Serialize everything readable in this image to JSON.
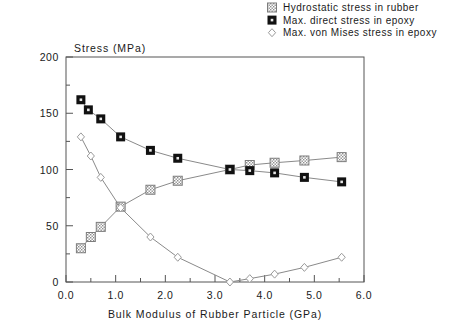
{
  "chart_data": {
    "type": "line",
    "title": "",
    "xlabel": "Bulk Modulus of Rubber Particle (GPa)",
    "ylabel": "Stress (MPa)",
    "xlim": [
      0.0,
      6.0
    ],
    "ylim": [
      0,
      200
    ],
    "xticks": [
      "0.0",
      "1.0",
      "2.0",
      "3.0",
      "4.0",
      "5.0",
      "6.0"
    ],
    "yticks": [
      "0",
      "50",
      "100",
      "150",
      "200"
    ],
    "xtick_values": [
      0.0,
      1.0,
      2.0,
      3.0,
      4.0,
      5.0,
      6.0
    ],
    "ytick_values": [
      0,
      50,
      100,
      150,
      200
    ],
    "xminor_step": 0.5,
    "yminor_step": 25,
    "grid": false,
    "legend_position": "top-right",
    "series": [
      {
        "name": "Hydrostatic stress in rubber",
        "marker": "square-gray-crosshatch",
        "color": "#9a9a9a",
        "points": [
          [
            0.3,
            30
          ],
          [
            0.5,
            40
          ],
          [
            0.7,
            49
          ],
          [
            1.1,
            67
          ],
          [
            1.7,
            82
          ],
          [
            2.25,
            90
          ],
          [
            3.3,
            100
          ],
          [
            3.7,
            104
          ],
          [
            4.2,
            106
          ],
          [
            4.8,
            108
          ],
          [
            5.55,
            111
          ]
        ]
      },
      {
        "name": "Max. direct stress in epoxy",
        "marker": "square-filled-black",
        "color": "#111111",
        "points": [
          [
            0.3,
            162
          ],
          [
            0.45,
            153
          ],
          [
            0.7,
            145
          ],
          [
            1.1,
            129
          ],
          [
            1.7,
            117
          ],
          [
            2.25,
            110
          ],
          [
            3.3,
            100
          ],
          [
            3.7,
            99
          ],
          [
            4.2,
            97
          ],
          [
            4.8,
            93
          ],
          [
            5.55,
            89
          ]
        ]
      },
      {
        "name": "Max. von Mises stress in epoxy",
        "marker": "diamond-open",
        "color": "#9a9a9a",
        "points": [
          [
            0.3,
            129
          ],
          [
            0.5,
            112
          ],
          [
            0.7,
            93
          ],
          [
            1.1,
            66
          ],
          [
            1.7,
            40
          ],
          [
            2.25,
            22
          ],
          [
            3.3,
            0
          ],
          [
            3.7,
            3
          ],
          [
            4.2,
            7
          ],
          [
            4.8,
            13
          ],
          [
            5.55,
            22
          ]
        ]
      }
    ]
  },
  "legend": {
    "items": [
      {
        "label": "Hydrostatic stress in rubber",
        "marker": "square-gray-crosshatch"
      },
      {
        "label": "Max. direct stress in epoxy",
        "marker": "square-filled-black"
      },
      {
        "label": "Max. von Mises stress in epoxy",
        "marker": "diamond-open"
      }
    ]
  }
}
